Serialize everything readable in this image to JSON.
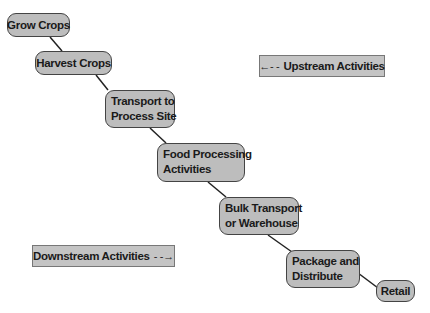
{
  "diagram": {
    "nodes": [
      {
        "id": "grow",
        "label": "Grow Crops"
      },
      {
        "id": "harvest",
        "label": "Harvest Crops"
      },
      {
        "id": "transport",
        "line1": "Transport to",
        "line2": "Process Site"
      },
      {
        "id": "food",
        "line1": "Food Processing",
        "line2": "Activities"
      },
      {
        "id": "bulk",
        "line1": "Bulk Transport",
        "line2": "or Warehouse"
      },
      {
        "id": "package",
        "line1": "Package and",
        "line2": "Distribute"
      },
      {
        "id": "retail",
        "label": "Retail"
      }
    ],
    "edges": [
      [
        "grow",
        "harvest"
      ],
      [
        "harvest",
        "transport"
      ],
      [
        "transport",
        "food"
      ],
      [
        "food",
        "bulk"
      ],
      [
        "bulk",
        "package"
      ],
      [
        "package",
        "retail"
      ]
    ],
    "legend": {
      "upstream": {
        "arrow": "←- -",
        "label": "Upstream Activities"
      },
      "downstream": {
        "label": "Downstream Activities",
        "arrow": "- -→"
      }
    },
    "colors": {
      "node_fill": "#bdbdbd",
      "node_border": "#444444",
      "line": "#222222"
    }
  }
}
